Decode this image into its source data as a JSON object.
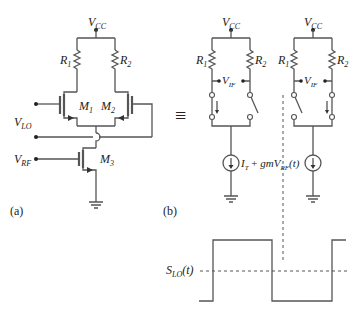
{
  "panel_a": {
    "caption": "(a)",
    "supply_label": "V",
    "supply_sub": "CC",
    "resistors": [
      {
        "label": "R",
        "sub": "1"
      },
      {
        "label": "R",
        "sub": "2"
      }
    ],
    "transistors": [
      {
        "label": "M",
        "sub": "1"
      },
      {
        "label": "M",
        "sub": "2"
      },
      {
        "label": "M",
        "sub": "3"
      }
    ],
    "inputs": [
      {
        "label": "V",
        "sub": "LO"
      },
      {
        "label": "V",
        "sub": "RF"
      }
    ]
  },
  "panel_b": {
    "caption": "(b)",
    "equivalence_symbol": "≡",
    "cells": [
      {
        "supply_label": "V",
        "supply_sub": "CC",
        "r1": {
          "label": "R",
          "sub": "1"
        },
        "r2": {
          "label": "R",
          "sub": "2"
        },
        "output": {
          "label": "V",
          "sub": "IF"
        },
        "left_switch": "closed",
        "right_switch": "open"
      },
      {
        "supply_label": "V",
        "supply_sub": "CC",
        "r1": {
          "label": "R",
          "sub": "1"
        },
        "r2": {
          "label": "R",
          "sub": "2"
        },
        "output": {
          "label": "V",
          "sub": "IF"
        },
        "left_switch": "open",
        "right_switch": "closed"
      }
    ],
    "current_source_label": {
      "main": "I",
      "main_sub": "T",
      "plus": " + ",
      "gm": "gmV",
      "gm_sub": "RF",
      "arg": "(t)"
    }
  },
  "waveform": {
    "label": "S",
    "label_sub": "LO",
    "label_arg": "(t)",
    "type": "square-wave",
    "levels": {
      "high": 240,
      "low": 301,
      "mid": 271
    },
    "transitions_x": [
      213,
      272,
      332
    ]
  }
}
